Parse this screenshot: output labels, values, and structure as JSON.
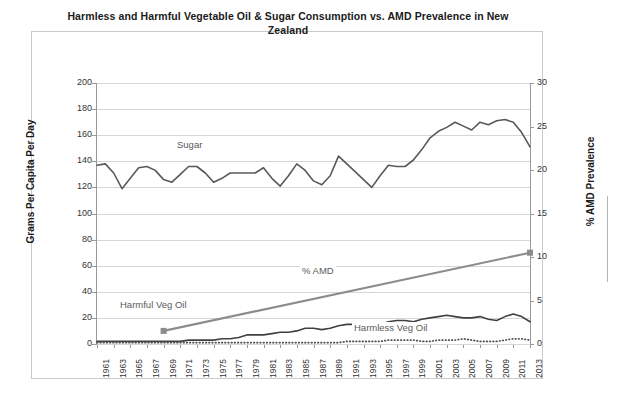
{
  "chart_data": {
    "type": "line",
    "title": "Harmless and Harmful Vegetable Oil & Sugar Consumption vs. AMD Prevalence in New Zealand",
    "xlabel": "",
    "ylabel": "Grams Per Capita Per Day",
    "ylabel_secondary": "% AMD Prevalence",
    "ylim": [
      0,
      200
    ],
    "ylim_secondary": [
      0,
      30
    ],
    "ytick_step": 20,
    "ytick_step_secondary": 5,
    "grid": true,
    "legend_position": "inline-annotations",
    "yticks": [
      "200",
      "180",
      "160",
      "140",
      "120",
      "100",
      "80",
      "60",
      "40",
      "20",
      "0"
    ],
    "yticks_secondary": [
      "30",
      "25",
      "20",
      "15",
      "10",
      "5",
      "0"
    ],
    "x": [
      1961,
      1962,
      1963,
      1964,
      1965,
      1966,
      1967,
      1968,
      1969,
      1970,
      1971,
      1972,
      1973,
      1974,
      1975,
      1976,
      1977,
      1978,
      1979,
      1980,
      1981,
      1982,
      1983,
      1984,
      1985,
      1986,
      1987,
      1988,
      1989,
      1990,
      1991,
      1992,
      1993,
      1994,
      1995,
      1996,
      1997,
      1998,
      1999,
      2000,
      2001,
      2002,
      2003,
      2004,
      2005,
      2006,
      2007,
      2008,
      2009,
      2010,
      2011,
      2012,
      2013
    ],
    "xtick_labels": [
      "1961",
      "1963",
      "1965",
      "1967",
      "1969",
      "1971",
      "1973",
      "1975",
      "1977",
      "1979",
      "1981",
      "1983",
      "1985",
      "1987",
      "1989",
      "1991",
      "1993",
      "1995",
      "1997",
      "1999",
      "2001",
      "2003",
      "2005",
      "2007",
      "2009",
      "2011",
      "2013"
    ],
    "series": [
      {
        "name": "Sugar",
        "axis": "left",
        "units": "grams per capita per day",
        "color": "#595959",
        "style": "solid",
        "values": [
          137,
          138,
          131,
          119,
          127,
          135,
          136,
          133,
          126,
          124,
          130,
          136,
          136,
          131,
          124,
          127,
          131,
          131,
          131,
          131,
          135,
          127,
          121,
          129,
          138,
          133,
          125,
          122,
          129,
          144,
          138,
          132,
          126,
          120,
          129,
          137,
          136,
          136,
          141,
          149,
          158,
          163,
          166,
          170,
          167,
          164,
          170,
          168,
          171,
          172,
          170,
          162,
          151
        ]
      },
      {
        "name": "% AMD",
        "axis": "right",
        "units": "% prevalence",
        "color": "#8c8c8c",
        "style": "solid-with-markers",
        "marker_years": [
          1969,
          2013
        ],
        "marker_values": [
          1.5,
          10.5
        ],
        "values_endpoints": [
          [
            1969,
            1.5
          ],
          [
            2013,
            10.5
          ]
        ]
      },
      {
        "name": "Harmful Veg Oil",
        "axis": "left",
        "units": "grams per capita per day",
        "color": "#404040",
        "style": "solid",
        "values": [
          2,
          2,
          2,
          2,
          2,
          2,
          2,
          2,
          2,
          2,
          2,
          3,
          3,
          3,
          3,
          4,
          4,
          5,
          7,
          7,
          7,
          8,
          9,
          9,
          10,
          12,
          12,
          11,
          12,
          14,
          15,
          15,
          14,
          14,
          15,
          17,
          18,
          18,
          17,
          19,
          20,
          21,
          22,
          21,
          20,
          20,
          21,
          19,
          18,
          21,
          23,
          21,
          17
        ]
      },
      {
        "name": "Harmless Veg Oil",
        "axis": "left",
        "units": "grams per capita per day",
        "color": "#4d4d4d",
        "style": "dotted",
        "values": [
          1,
          1,
          1,
          1,
          1,
          1,
          1,
          1,
          1,
          1,
          1,
          1,
          1,
          1,
          1,
          1,
          1,
          1,
          1,
          1,
          1,
          1,
          1,
          1,
          1,
          1,
          1,
          1,
          1,
          1,
          2,
          2,
          2,
          2,
          2,
          3,
          3,
          3,
          3,
          2,
          2,
          3,
          3,
          3,
          4,
          3,
          2,
          2,
          2,
          3,
          4,
          4,
          3
        ]
      }
    ],
    "annotations": [
      {
        "text": "Sugar",
        "x": 1973,
        "y": 152
      },
      {
        "text": "% AMD",
        "x": 1999,
        "y": 47
      },
      {
        "text": "Harmful Veg Oil",
        "x": 1964,
        "y": 30
      },
      {
        "text": "Harmless Veg Oil",
        "x": 2003,
        "y": 12
      }
    ],
    "colors": {
      "sugar": "#595959",
      "amd": "#8c8c8c",
      "harmful_veg_oil": "#404040",
      "harmless_veg_oil": "#4d4d4d",
      "gridline": "#d6d6d6",
      "axis": "#9a9a9a",
      "frame": "#c9c9c9",
      "text": "#1a1a1a"
    }
  }
}
